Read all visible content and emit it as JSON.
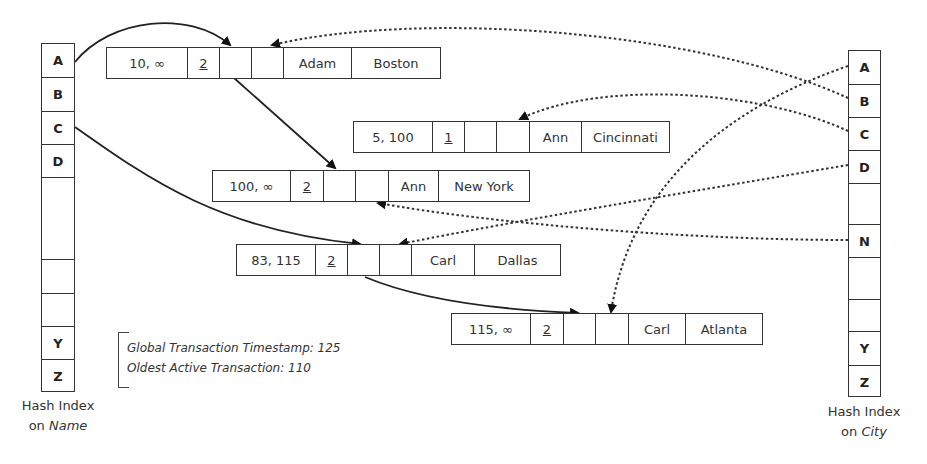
{
  "name_index": {
    "label_line1": "Hash Index",
    "label_line2": "on",
    "label_line2_italic": "Name",
    "cells": [
      "A",
      "B",
      "C",
      "D",
      "",
      "",
      "",
      "Y",
      "Z"
    ]
  },
  "city_index": {
    "label_line1": "Hash Index",
    "label_line2": "on",
    "label_line2_italic": "City",
    "cells": [
      "A",
      "B",
      "C",
      "D",
      "",
      "N",
      "",
      "",
      "Y",
      "Z"
    ]
  },
  "versions": [
    {
      "timestamp": "10, ∞",
      "txn": "2",
      "ptr_name": "",
      "ptr_city": "",
      "name": "Adam",
      "city": "Boston"
    },
    {
      "timestamp": "5, 100",
      "txn": "1",
      "ptr_name": "",
      "ptr_city": "",
      "name": "Ann",
      "city": "Cincinnati"
    },
    {
      "timestamp": "100, ∞",
      "txn": "2",
      "ptr_name": "",
      "ptr_city": "",
      "name": "Ann",
      "city": "New York"
    },
    {
      "timestamp": "83, 115",
      "txn": "2",
      "ptr_name": "",
      "ptr_city": "",
      "name": "Carl",
      "city": "Dallas"
    },
    {
      "timestamp": "115, ∞",
      "txn": "2",
      "ptr_name": "",
      "ptr_city": "",
      "name": "Carl",
      "city": "Atlanta"
    }
  ],
  "note": {
    "global_ts": "Global Transaction Timestamp: 125",
    "oldest_active": "Oldest Active Transaction: 110"
  },
  "links": {
    "name_index_links": [
      {
        "from": "A",
        "to": "Adam/Boston"
      },
      {
        "from": "C",
        "to": "Carl/Dallas"
      }
    ],
    "name_chain_links": [
      {
        "from": "Adam/Boston",
        "to": "Ann/New York"
      },
      {
        "from": "Carl/Dallas",
        "to": "Carl/Atlanta"
      }
    ],
    "city_index_links": [
      {
        "from": "A",
        "to": "Carl/Atlanta"
      },
      {
        "from": "B",
        "to": "Adam/Boston"
      },
      {
        "from": "C",
        "to": "Ann/Cincinnati"
      },
      {
        "from": "D",
        "to": "Carl/Dallas"
      },
      {
        "from": "N",
        "to": "Ann/New York"
      }
    ]
  },
  "colors": {
    "line": "#222222",
    "border": "#333333",
    "background": "#ffffff"
  }
}
